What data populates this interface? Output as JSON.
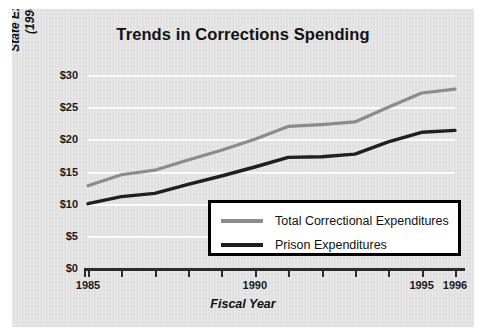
{
  "chart_data": {
    "type": "line",
    "title": "Trends in Corrections Spending",
    "xlabel": "Fiscal Year",
    "ylabel": "State Expenditures in Billions (1996 Constant Dollars)",
    "ylabel_line1": "State Expenditures in Billions",
    "ylabel_line2": "(1996 Constant Dollars)",
    "grid": true,
    "legend_position": "inside-bottom-right",
    "x": [
      1985,
      1986,
      1987,
      1988,
      1989,
      1990,
      1991,
      1992,
      1993,
      1994,
      1995,
      1996
    ],
    "xlim": [
      1985,
      1996
    ],
    "ylim": [
      0,
      30
    ],
    "ytick_values": [
      0,
      5,
      10,
      15,
      20,
      25,
      30
    ],
    "ytick_labels": [
      "$0",
      "$5",
      "$10",
      "$15",
      "$20",
      "$25",
      "$30"
    ],
    "xtick_values": [
      1985,
      1986,
      1987,
      1988,
      1989,
      1990,
      1991,
      1992,
      1993,
      1994,
      1995,
      1996
    ],
    "xtick_labels": [
      "1985",
      "",
      "",
      "",
      "",
      "1990",
      "",
      "",
      "",
      "",
      "1995",
      "1996"
    ],
    "series": [
      {
        "name": "Total Correctional Expenditures",
        "color": "#8c8c8c",
        "values": [
          12.8,
          14.5,
          15.2,
          16.8,
          18.3,
          20.0,
          22.0,
          22.3,
          22.7,
          25.0,
          27.2,
          27.8
        ]
      },
      {
        "name": "Prison Expenditures",
        "color": "#1f1f1f",
        "values": [
          10.0,
          11.1,
          11.6,
          13.0,
          14.3,
          15.7,
          17.2,
          17.3,
          17.7,
          19.6,
          21.1,
          21.4
        ]
      }
    ]
  },
  "figure": {
    "background": "#e3e3e3",
    "gridline_color": "#fbfbfb",
    "axis_color": "#2b2b2b",
    "legend_border_color": "#000000",
    "legend_background": "#ffffff"
  }
}
